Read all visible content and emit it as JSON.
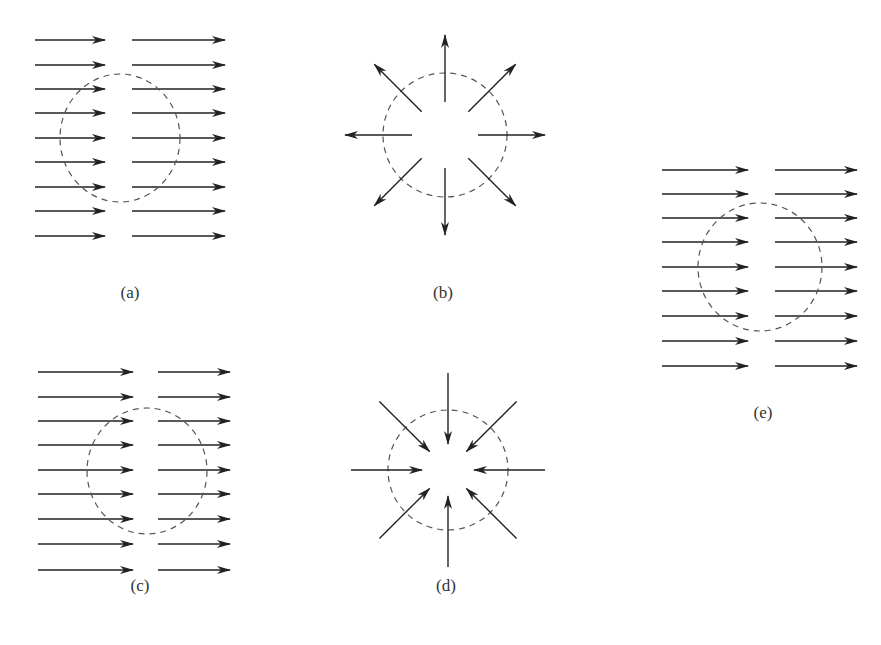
{
  "figure": {
    "colors": {
      "arrow": "#222222",
      "circle": "#555555",
      "background": "#ffffff"
    },
    "panels": [
      {
        "id": "a",
        "label": "(a)",
        "type": "uniform-flow",
        "label_pos": [
          130,
          295
        ],
        "circle": {
          "cx": 120,
          "cy": 138,
          "rx": 60,
          "ry": 64
        },
        "rows_y": [
          40,
          65,
          89,
          113,
          138,
          162,
          187,
          211,
          236
        ],
        "left_arrow": {
          "x1": 35,
          "x2": 105
        },
        "right_arrow": {
          "x1": 132,
          "x2": 225
        }
      },
      {
        "id": "b",
        "label": "(b)",
        "type": "radial-outward",
        "label_pos": [
          443,
          295
        ],
        "center": [
          445,
          135
        ],
        "circle_r": 62,
        "inner_r": 33,
        "outer_r": 100,
        "angles_deg": [
          0,
          45,
          90,
          135,
          180,
          225,
          270,
          315
        ]
      },
      {
        "id": "c",
        "label": "(c)",
        "type": "uniform-flow",
        "label_pos": [
          140,
          588
        ],
        "circle": {
          "cx": 147,
          "cy": 471,
          "rx": 60,
          "ry": 63
        },
        "rows_y": [
          372,
          397,
          421,
          445,
          470,
          494,
          519,
          544,
          570
        ],
        "left_arrow": {
          "x1": 38,
          "x2": 133
        },
        "right_arrow": {
          "x1": 158,
          "x2": 230
        }
      },
      {
        "id": "d",
        "label": "(d)",
        "type": "radial-inward",
        "label_pos": [
          446,
          588
        ],
        "center": [
          448,
          470
        ],
        "circle_r": 60,
        "inner_r": 26,
        "outer_r": 97,
        "angles_deg": [
          0,
          45,
          90,
          135,
          180,
          225,
          270,
          315
        ]
      },
      {
        "id": "e",
        "label": "(e)",
        "type": "uniform-flow",
        "label_pos": [
          763,
          415
        ],
        "circle": {
          "cx": 760,
          "cy": 267,
          "rx": 62,
          "ry": 64
        },
        "rows_y": [
          170,
          194,
          218,
          242,
          267,
          291,
          316,
          341,
          366
        ],
        "left_arrow": {
          "x1": 662,
          "x2": 748
        },
        "right_arrow": {
          "x1": 775,
          "x2": 857
        }
      }
    ]
  }
}
